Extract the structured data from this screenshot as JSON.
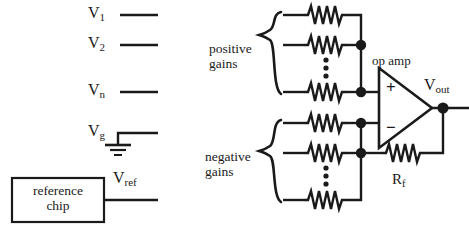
{
  "figure": {
    "type": "circuit-schematic",
    "stroke_color": "#1a1a1a",
    "background_color": "#ffffff"
  },
  "inputs": {
    "signals": [
      {
        "name": "V1",
        "base": "V",
        "sub": "1"
      },
      {
        "name": "V2",
        "base": "V",
        "sub": "2"
      },
      {
        "name": "Vn",
        "base": "V",
        "sub": "n"
      },
      {
        "name": "Vg",
        "base": "V",
        "sub": "g"
      },
      {
        "name": "Vref",
        "base": "V",
        "sub": "ref"
      }
    ],
    "ground_symbol": "earth-ground",
    "reference_block": {
      "line1": "reference",
      "line2": "chip"
    }
  },
  "banks": [
    {
      "id": "positive",
      "label_line1": "positive",
      "label_line2": "gains",
      "brace": "left-curly-brace",
      "resistor_count_visible": 3,
      "ellipsis": "vertical-dots",
      "connects_to": "op-amp non-inverting input"
    },
    {
      "id": "negative",
      "label_line1": "negative",
      "label_line2": "gains",
      "brace": "left-curly-brace",
      "resistor_count_visible": 3,
      "ellipsis": "vertical-dots",
      "connects_to": "op-amp inverting input"
    }
  ],
  "opamp": {
    "label": "op amp",
    "plus_terminal": "+",
    "minus_terminal": "−",
    "output": {
      "base": "V",
      "sub": "out"
    }
  },
  "feedback": {
    "resistor": {
      "base": "R",
      "sub": "f"
    },
    "from": "output node",
    "to": "inverting input bus"
  }
}
